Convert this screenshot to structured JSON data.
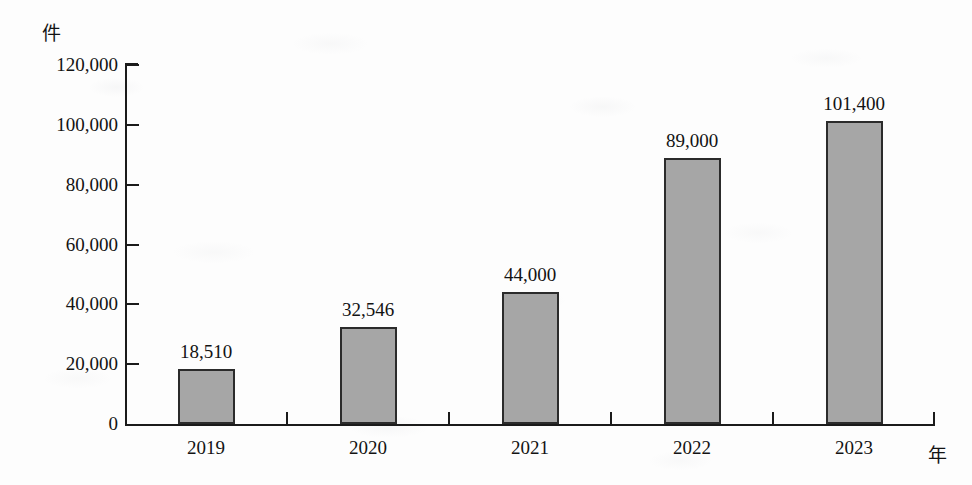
{
  "chart_data": {
    "type": "bar",
    "title": "",
    "subtitle": "",
    "xlabel": "年",
    "ylabel": "件",
    "categories": [
      "2019",
      "2020",
      "2021",
      "2022",
      "2023"
    ],
    "values": [
      18510,
      32546,
      44000,
      89000,
      101400
    ],
    "value_labels": [
      "18,510",
      "32,546",
      "44,000",
      "89,000",
      "101,400"
    ],
    "ylim": [
      0,
      120000
    ],
    "ytick_values": [
      0,
      20000,
      40000,
      60000,
      80000,
      100000,
      120000
    ],
    "ytick_labels": [
      "0",
      "20,000",
      "40,000",
      "60,000",
      "80,000",
      "100,000",
      "120,000"
    ],
    "grid": false,
    "legend": null,
    "legend_position": "none",
    "series": [
      {
        "name": "件数",
        "values": [
          18510,
          32546,
          44000,
          89000,
          101400
        ]
      }
    ],
    "colors": {
      "bar_fill": "#a6a6a6",
      "bar_border": "#2b2b2b",
      "axis": "#1b1b1b",
      "text": "#131313",
      "background": "#fdfdfd"
    }
  },
  "axis": {
    "y_unit_label": "件",
    "x_unit_label": "年"
  }
}
